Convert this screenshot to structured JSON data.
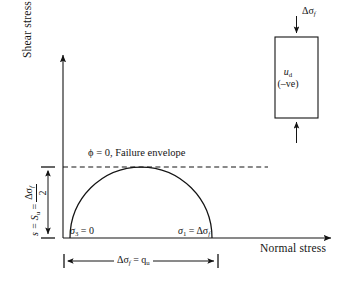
{
  "figure": {
    "background_color": "#ffffff",
    "line_color": "#141414"
  },
  "axes": {
    "y_axis_label": "Shear stress",
    "x_axis_label": "Normal stress",
    "origin": {
      "x": 63,
      "y": 238
    },
    "x_axis_end": {
      "x": 335,
      "y": 238
    },
    "y_axis_top": {
      "x": 63,
      "y": 52
    }
  },
  "envelope": {
    "label": "ϕ = 0, Failure envelope",
    "line_style": "dashed",
    "y": 167,
    "x_start": 63,
    "x_end": 268
  },
  "mohr_circle": {
    "type": "semicircle",
    "center_x": 141,
    "baseline_y": 238,
    "radius": 71,
    "sigma3_label": "σ",
    "sigma3_sub": "3",
    "sigma3_value": " = 0",
    "sigma1_label": "σ",
    "sigma1_sub": "1",
    "sigma1_value": " = Δσ",
    "sigma1_value_sub": "f"
  },
  "dimensions": {
    "vertical": {
      "prefix": "s = S",
      "prefix_sub": "u",
      "equals": " = ",
      "fraction_numerator": "Δσ",
      "fraction_numerator_sub": "f",
      "fraction_denominator": "2",
      "top_y": 167,
      "bottom_y": 238,
      "x": 48
    },
    "horizontal": {
      "label": "Δσ",
      "label_sub": "f",
      "label_rest": " = q",
      "label_rest_sub": "u",
      "left_x": 64,
      "right_x": 218,
      "y": 261
    }
  },
  "sample": {
    "top_load_label": "Δσ",
    "top_load_sub": "f",
    "pore_pressure_label": "u",
    "pore_pressure_sub": "d",
    "pore_pressure_sign": "(–ve)",
    "box": {
      "x": 275,
      "y": 37,
      "width": 43,
      "height": 81
    }
  }
}
